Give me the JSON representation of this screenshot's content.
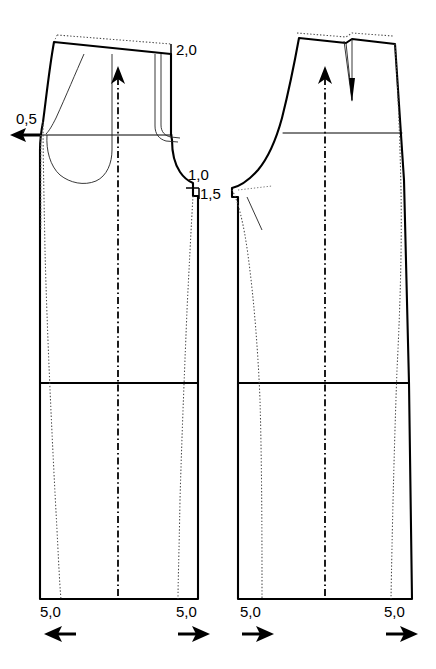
{
  "document": {
    "type": "technical-sewing-pattern",
    "title": "Trouser pattern alteration diagram",
    "background_color": "#ffffff",
    "line_color": "#000000",
    "width": 436,
    "height": 669
  },
  "annotations": {
    "waist_front": {
      "label": "2,0",
      "x": 176,
      "y": 55,
      "tick": {
        "x": 171,
        "y1": 44,
        "y2": 54
      }
    },
    "side_seam_front": {
      "label": "0,5",
      "x": 18,
      "y": 124,
      "arrow": {
        "direction": "left",
        "x": 40,
        "y": 135
      }
    },
    "crotch_horizontal": {
      "label": "1,0",
      "x": 190,
      "y": 177
    },
    "crotch_vertical": {
      "label": "1,5",
      "x": 196,
      "y": 196
    },
    "hem_front_inseam": {
      "label": "5,0",
      "x": 42,
      "y": 617,
      "arrow": {
        "direction": "left",
        "x": 58,
        "y": 634
      }
    },
    "hem_front_sideseam": {
      "label": "5,0",
      "x": 178,
      "y": 617,
      "arrow": {
        "direction": "right",
        "x": 193,
        "y": 634
      }
    },
    "hem_back_inseam": {
      "label": "5,0",
      "x": 242,
      "y": 617,
      "arrow": {
        "direction": "right",
        "x": 257,
        "y": 634
      }
    },
    "hem_back_sideseam": {
      "label": "5,0",
      "x": 386,
      "y": 617,
      "arrow": {
        "direction": "right",
        "x": 400,
        "y": 634
      }
    }
  },
  "pieces": [
    {
      "name": "front-trouser-piece",
      "label": "Front",
      "grainline": {
        "x": 118,
        "y_top": 70,
        "y_bottom": 597
      },
      "features": [
        "lowered-waistline",
        "original-waistline-dotted",
        "side-pocket-opening",
        "pocket-bag",
        "fly-front",
        "hip-line",
        "knee-line",
        "widened-leg-outline",
        "original-leg-dotted"
      ]
    },
    {
      "name": "back-trouser-piece",
      "label": "Back",
      "grainline": {
        "x": 325,
        "y_top": 70,
        "y_bottom": 597
      },
      "features": [
        "lowered-waistline",
        "original-waistline-dotted",
        "back-dart",
        "hip-line",
        "knee-line",
        "widened-leg-outline",
        "original-leg-dotted"
      ]
    }
  ],
  "reference_lines": {
    "hip_line_y": 135,
    "knee_line_y": 383,
    "hem_line_y": 599
  },
  "icons": {
    "arrow_left": "◄",
    "arrow_right": "►",
    "arrow_up": "▲"
  }
}
